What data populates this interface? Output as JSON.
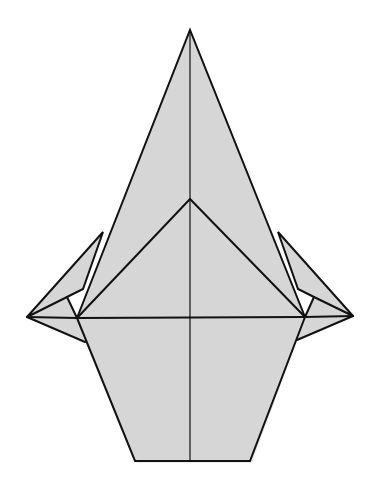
{
  "diagram": {
    "colors": {
      "paper": "#d6d6d6",
      "line": "#111111",
      "background": "#ffffff"
    },
    "points": {
      "apex": [
        190,
        30
      ],
      "inner_apex": [
        190,
        199
      ],
      "left_tip": [
        27,
        317
      ],
      "right_tip": [
        353,
        316
      ],
      "left_junction": [
        77,
        318
      ],
      "right_junction": [
        305,
        317
      ],
      "left_flap_top": [
        103,
        232
      ],
      "right_flap_top": [
        278,
        232
      ],
      "left_notch": [
        83,
        289
      ],
      "right_notch": [
        298,
        289
      ],
      "left_inner": [
        67,
        297
      ],
      "right_inner": [
        314,
        297
      ],
      "left_lower_corner": [
        85,
        342
      ],
      "right_lower_corner": [
        297,
        340
      ],
      "bottom_left": [
        135,
        461
      ],
      "bottom_right": [
        250,
        461
      ]
    }
  }
}
